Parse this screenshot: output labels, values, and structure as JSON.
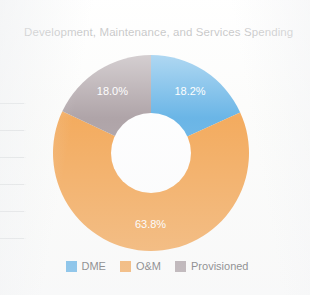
{
  "page": {
    "background_color": "#fdfdfc",
    "rule_line_color": "#d7d9da"
  },
  "chart_panel": {
    "title": "Development, Maintenance, and Services Spending"
  },
  "legend": {
    "items": [
      {
        "label": "DME",
        "color": "#3b9fe0",
        "swatch_name": "legend-swatch-dme"
      },
      {
        "label": "O&M",
        "color": "#f2922c",
        "swatch_name": "legend-swatch-om"
      },
      {
        "label": "Provisioned",
        "color": "#97888d",
        "swatch_name": "legend-swatch-provisioned"
      }
    ]
  },
  "chart_data": {
    "type": "pie",
    "variant": "donut",
    "title": "Development, Maintenance, and Services Spending",
    "xlabel": "",
    "ylabel": "",
    "legend_position": "bottom",
    "grid": false,
    "start_angle_deg": 0,
    "direction": "clockwise",
    "hole_ratio": 0.41,
    "categories": [
      "DME",
      "O&M",
      "Provisioned"
    ],
    "values": [
      18.2,
      63.8,
      18.0
    ],
    "value_unit": "percent",
    "colors": [
      "#3b9fe0",
      "#f2922c",
      "#97888d"
    ],
    "slices": [
      {
        "name": "DME",
        "value": 18.2,
        "label": "18.2%",
        "color": "#3b9fe0",
        "label_color": "#ffffff"
      },
      {
        "name": "O&M",
        "value": 63.8,
        "label": "63.8%",
        "color": "#f2922c",
        "label_color": "#ffffff"
      },
      {
        "name": "Provisioned",
        "value": 18.0,
        "label": "18.0%",
        "color": "#97888d",
        "label_color": "#ffffff"
      }
    ]
  }
}
